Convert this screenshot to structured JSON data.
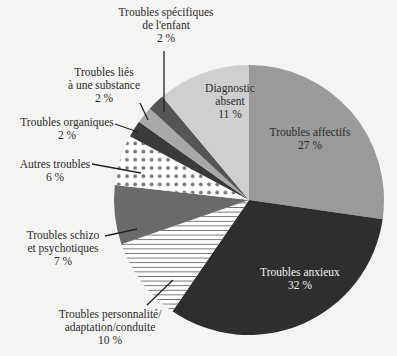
{
  "chart_data": {
    "type": "pie",
    "title": "",
    "start_angle_deg": 0,
    "direction": "clockwise",
    "center": [
      249,
      200
    ],
    "radius": 135,
    "slices": [
      {
        "label": "Troubles affectifs",
        "value": 27,
        "display": "27 %",
        "fill": "#9a9a9a",
        "pattern": "solid"
      },
      {
        "label": "Troubles anxieux",
        "value": 32,
        "display": "32 %",
        "fill": "#2e2e2e",
        "pattern": "solid"
      },
      {
        "label": "Troubles personnalité/adaptation/conduite",
        "value": 10,
        "display": "10 %",
        "fill": "#ffffff",
        "pattern": "hlines"
      },
      {
        "label": "Troubles schizo et psychotiques",
        "value": 7,
        "display": "7 %",
        "fill": "#6a6a6a",
        "pattern": "solid"
      },
      {
        "label": "Autres troubles",
        "value": 6,
        "display": "6 %",
        "fill": "#ffffff",
        "pattern": "dots"
      },
      {
        "label": "Troubles organiques",
        "value": 2,
        "display": "2 %",
        "fill": "#3a3a3a",
        "pattern": "solid"
      },
      {
        "label": "Troubles liés à une substance",
        "value": 2,
        "display": "2 %",
        "fill": "#a8a8a8",
        "pattern": "solid"
      },
      {
        "label": "Troubles spécifiques de l'enfant",
        "value": 2,
        "display": "2 %",
        "fill": "#555555",
        "pattern": "solid"
      },
      {
        "label": "Diagnostic absent",
        "value": 11,
        "display": "11 %",
        "fill": "#cfcfcf",
        "pattern": "solid"
      }
    ]
  },
  "labels": {
    "affectifs": {
      "line1": "Troubles affectifs",
      "pct": "27 %"
    },
    "anxieux": {
      "line1": "Troubles anxieux",
      "pct": "32 %"
    },
    "personnalite": {
      "line1": "Troubles personnalité/",
      "line2": "adaptation/conduite",
      "pct": "10 %"
    },
    "schizo": {
      "line1": "Troubles schizo",
      "line2": "et psychotiques",
      "pct": "7 %"
    },
    "autres": {
      "line1": "Autres troubles",
      "pct": "6 %"
    },
    "organiques": {
      "line1": "Troubles organiques",
      "pct": "2 %"
    },
    "substance": {
      "line1": "Troubles liés",
      "line2": "à une substance",
      "pct": "2 %"
    },
    "enfant": {
      "line1": "Troubles spécifiques",
      "line2": "de l'enfant",
      "pct": "2 %"
    },
    "absent": {
      "line1": "Diagnostic",
      "line2": "absent",
      "pct": "11 %"
    }
  }
}
